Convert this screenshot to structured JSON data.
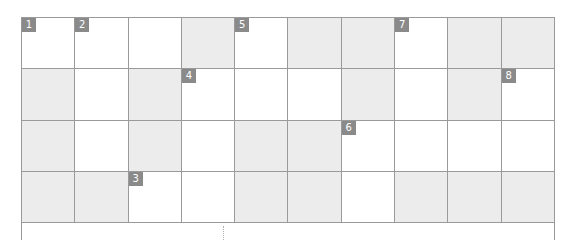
{
  "puzzle": {
    "type": "crossword",
    "rows": 4,
    "cols": 10,
    "colors": {
      "grid_line": "#9a9a9a",
      "blocked_cell": "#ececec",
      "open_cell": "#ffffff",
      "number_badge_bg": "#8a8a8a",
      "number_badge_text": "#ffffff"
    },
    "cells": [
      [
        {
          "blocked": false,
          "number": "1",
          "letter": ""
        },
        {
          "blocked": false,
          "number": "2",
          "letter": ""
        },
        {
          "blocked": false,
          "number": "",
          "letter": ""
        },
        {
          "blocked": true,
          "number": "",
          "letter": ""
        },
        {
          "blocked": false,
          "number": "5",
          "letter": ""
        },
        {
          "blocked": true,
          "number": "",
          "letter": ""
        },
        {
          "blocked": true,
          "number": "",
          "letter": ""
        },
        {
          "blocked": false,
          "number": "7",
          "letter": ""
        },
        {
          "blocked": true,
          "number": "",
          "letter": ""
        },
        {
          "blocked": true,
          "number": "",
          "letter": ""
        }
      ],
      [
        {
          "blocked": true,
          "number": "",
          "letter": ""
        },
        {
          "blocked": false,
          "number": "",
          "letter": ""
        },
        {
          "blocked": true,
          "number": "",
          "letter": ""
        },
        {
          "blocked": false,
          "number": "4",
          "letter": ""
        },
        {
          "blocked": false,
          "number": "",
          "letter": ""
        },
        {
          "blocked": false,
          "number": "",
          "letter": ""
        },
        {
          "blocked": true,
          "number": "",
          "letter": ""
        },
        {
          "blocked": false,
          "number": "",
          "letter": ""
        },
        {
          "blocked": true,
          "number": "",
          "letter": ""
        },
        {
          "blocked": false,
          "number": "8",
          "letter": ""
        }
      ],
      [
        {
          "blocked": true,
          "number": "",
          "letter": ""
        },
        {
          "blocked": false,
          "number": "",
          "letter": ""
        },
        {
          "blocked": true,
          "number": "",
          "letter": ""
        },
        {
          "blocked": false,
          "number": "",
          "letter": ""
        },
        {
          "blocked": true,
          "number": "",
          "letter": ""
        },
        {
          "blocked": true,
          "number": "",
          "letter": ""
        },
        {
          "blocked": false,
          "number": "6",
          "letter": ""
        },
        {
          "blocked": false,
          "number": "",
          "letter": ""
        },
        {
          "blocked": false,
          "number": "",
          "letter": ""
        },
        {
          "blocked": false,
          "number": "",
          "letter": ""
        }
      ],
      [
        {
          "blocked": true,
          "number": "",
          "letter": ""
        },
        {
          "blocked": true,
          "number": "",
          "letter": ""
        },
        {
          "blocked": false,
          "number": "3",
          "letter": ""
        },
        {
          "blocked": false,
          "number": "",
          "letter": ""
        },
        {
          "blocked": true,
          "number": "",
          "letter": ""
        },
        {
          "blocked": true,
          "number": "",
          "letter": ""
        },
        {
          "blocked": false,
          "number": "",
          "letter": ""
        },
        {
          "blocked": true,
          "number": "",
          "letter": ""
        },
        {
          "blocked": true,
          "number": "",
          "letter": ""
        },
        {
          "blocked": true,
          "number": "",
          "letter": ""
        }
      ]
    ]
  }
}
